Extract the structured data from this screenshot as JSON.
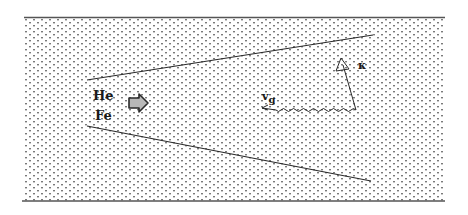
{
  "diagram": {
    "type": "physics-schematic",
    "background_pattern": "dot-stipple",
    "colors": {
      "background": "#ffffff",
      "stipple": "#7a7a7a",
      "line": "#2a2a2a",
      "arrow_fill": "#b8b8b8",
      "text": "#1a1a1a"
    },
    "labels": {
      "species_1": "He",
      "species_2": "Fe",
      "wave_vector": "κ",
      "group_velocity_base": "v",
      "group_velocity_sub": "g"
    },
    "elements": {
      "flow_arrow": "block-arrow-right",
      "wave_vector_arrow": "open-triangle-arrow",
      "group_velocity_arrow": "wavy-arrow-left",
      "cone_boundaries": [
        "upper-diverging-line",
        "lower-diverging-line"
      ]
    }
  }
}
